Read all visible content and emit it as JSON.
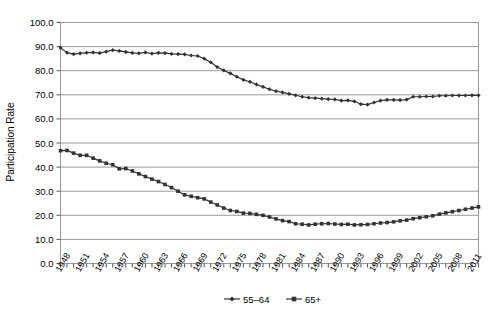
{
  "chart_data": {
    "type": "line",
    "title": "",
    "xlabel": "",
    "ylabel": "Participation Rate",
    "ylim": [
      0,
      100
    ],
    "ytick_labels": [
      "0.0",
      "10.0",
      "20.0",
      "30.0",
      "40.0",
      "50.0",
      "60.0",
      "70.0",
      "80.0",
      "90.0",
      "100.0"
    ],
    "ytick_values": [
      0,
      10,
      20,
      30,
      40,
      50,
      60,
      70,
      80,
      90,
      100
    ],
    "grid": "horizontal",
    "legend_position": "bottom-center",
    "xlim": [
      1948,
      2012
    ],
    "xtick_labels": [
      "1948",
      "1951",
      "1954",
      "1957",
      "1960",
      "1963",
      "1966",
      "1969",
      "1972",
      "1975",
      "1978",
      "1981",
      "1984",
      "1987",
      "1990",
      "1993",
      "1996",
      "1999",
      "2002",
      "2005",
      "2008",
      "2011"
    ],
    "xtick_values": [
      1948,
      1951,
      1954,
      1957,
      1960,
      1963,
      1966,
      1969,
      1972,
      1975,
      1978,
      1981,
      1984,
      1987,
      1990,
      1993,
      1996,
      1999,
      2002,
      2005,
      2008,
      2011
    ],
    "x": [
      1948,
      1949,
      1950,
      1951,
      1952,
      1953,
      1954,
      1955,
      1956,
      1957,
      1958,
      1959,
      1960,
      1961,
      1962,
      1963,
      1964,
      1965,
      1966,
      1967,
      1968,
      1969,
      1970,
      1971,
      1972,
      1973,
      1974,
      1975,
      1976,
      1977,
      1978,
      1979,
      1980,
      1981,
      1982,
      1983,
      1984,
      1985,
      1986,
      1987,
      1988,
      1989,
      1990,
      1991,
      1992,
      1993,
      1994,
      1995,
      1996,
      1997,
      1998,
      1999,
      2000,
      2001,
      2002,
      2003,
      2004,
      2005,
      2006,
      2007,
      2008,
      2009,
      2010,
      2011,
      2012
    ],
    "series": [
      {
        "name": "55–64",
        "marker": "diamond",
        "color": "#333333",
        "values": [
          89.5,
          87.5,
          86.9,
          87.2,
          87.5,
          87.6,
          87.3,
          87.9,
          88.5,
          88.2,
          87.8,
          87.4,
          87.2,
          87.6,
          87.1,
          87.4,
          87.3,
          87.0,
          86.9,
          86.8,
          86.3,
          86.1,
          85.0,
          83.5,
          81.5,
          80.1,
          78.9,
          77.5,
          76.2,
          75.4,
          74.3,
          73.3,
          72.3,
          71.5,
          71.0,
          70.4,
          69.8,
          69.2,
          68.8,
          68.6,
          68.4,
          68.2,
          68.1,
          67.6,
          67.7,
          67.3,
          66.1,
          65.9,
          66.8,
          67.6,
          67.9,
          67.9,
          67.8,
          68.0,
          69.2,
          69.2,
          69.3,
          69.3,
          69.6,
          69.6,
          69.7,
          69.7,
          69.7,
          69.8,
          69.8
        ]
      },
      {
        "name": "65+",
        "marker": "square",
        "color": "#333333",
        "values": [
          46.8,
          46.9,
          45.8,
          44.9,
          44.9,
          43.7,
          42.6,
          41.6,
          41.0,
          39.3,
          39.4,
          38.4,
          37.2,
          36.1,
          35.0,
          34.0,
          32.8,
          31.5,
          30.0,
          28.5,
          27.9,
          27.3,
          26.8,
          25.5,
          24.3,
          23.0,
          22.0,
          21.6,
          20.9,
          20.8,
          20.4,
          20.0,
          19.3,
          18.5,
          17.8,
          17.4,
          16.5,
          16.3,
          16.0,
          16.3,
          16.5,
          16.6,
          16.4,
          16.2,
          16.3,
          16.0,
          16.1,
          16.2,
          16.5,
          16.8,
          17.0,
          17.3,
          17.7,
          18.0,
          18.6,
          19.0,
          19.4,
          19.8,
          20.5,
          21.0,
          21.5,
          22.0,
          22.5,
          23.0,
          23.5
        ]
      }
    ]
  },
  "axis": {
    "y_axis_title": "Participation Rate"
  }
}
